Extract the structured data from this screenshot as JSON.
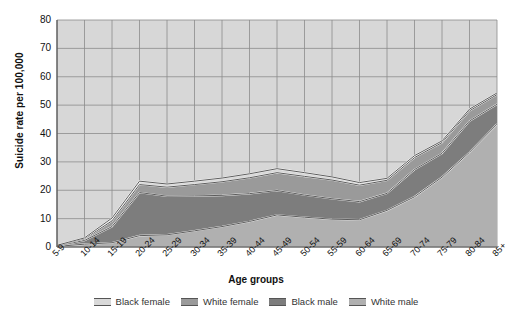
{
  "chart_data": {
    "type": "area",
    "stacked": true,
    "title": "",
    "xlabel": "Age groups",
    "ylabel": "Suicide rate per 100,000",
    "ylim": [
      0,
      80
    ],
    "ytick_step": 10,
    "yticks": [
      0,
      10,
      20,
      30,
      40,
      50,
      60,
      70,
      80
    ],
    "grid": true,
    "legend_position": "bottom",
    "categories": [
      "5-9",
      "10-14",
      "15-19",
      "20-24",
      "25-29",
      "30-34",
      "35-39",
      "40-44",
      "45-49",
      "50-54",
      "55-59",
      "60-64",
      "65-69",
      "70-74",
      "75-79",
      "80-84",
      "85+"
    ],
    "series": [
      {
        "name": "Black female",
        "color": "#d9d9d9",
        "values": [
          0.1,
          0.3,
          1.0,
          1.2,
          1.1,
          1.2,
          1.3,
          1.4,
          1.4,
          1.3,
          1.1,
          0.9,
          0.7,
          0.7,
          0.6,
          0.6,
          0.6
        ]
      },
      {
        "name": "White female",
        "color": "#9a9a9a",
        "values": [
          0.1,
          0.6,
          2.0,
          2.8,
          3.2,
          4.0,
          4.8,
          5.6,
          6.3,
          6.6,
          6.6,
          5.8,
          4.6,
          4.2,
          3.8,
          3.6,
          3.4
        ]
      },
      {
        "name": "Black male",
        "color": "#7d7d7d",
        "values": [
          0.2,
          1.3,
          5.7,
          15.2,
          13.6,
          12.3,
          11.0,
          9.8,
          8.6,
          7.8,
          7.2,
          6.4,
          6.0,
          9.6,
          8.4,
          11.0,
          7.0
        ]
      },
      {
        "name": "White male",
        "color": "#b0b0b0",
        "values": [
          0.2,
          1.0,
          1.5,
          4.0,
          4.3,
          5.7,
          7.2,
          9.0,
          11.3,
          10.5,
          9.8,
          9.6,
          12.9,
          17.7,
          24.6,
          33.4,
          43.3
        ]
      }
    ],
    "series_totals": [
      0.6,
      3.2,
      10.2,
      23.2,
      22.2,
      23.2,
      24.3,
      25.8,
      27.6,
      26.2,
      24.7,
      22.7,
      24.2,
      32.2,
      37.4,
      48.6,
      54.3
    ],
    "legend_entries": [
      "Black female",
      "White female",
      "Black male",
      "White male"
    ]
  },
  "style": {
    "plot_background": "#d7d7d7",
    "grid_color": "#8c8c8c",
    "axis_color": "#555555",
    "line_color": "#4a4a4a",
    "page_background": "#ffffff"
  }
}
